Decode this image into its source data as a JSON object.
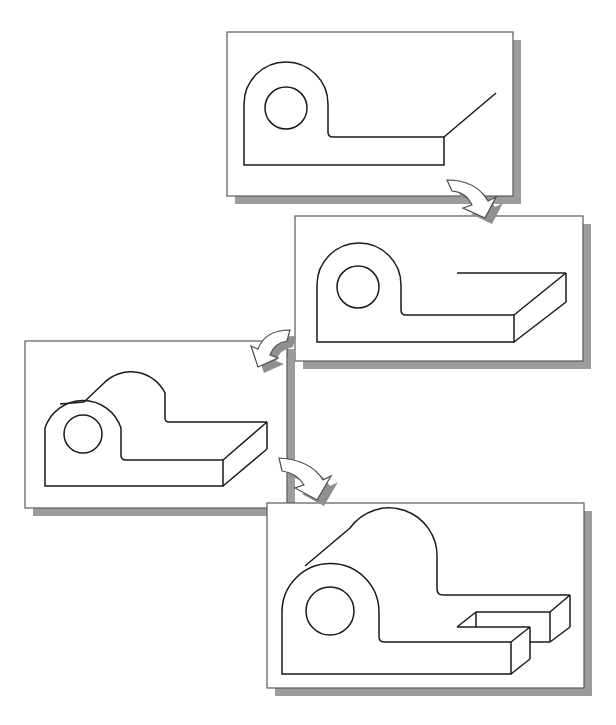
{
  "diagram": {
    "title": "",
    "colors": {
      "background": "#ffffff",
      "panel_fill": "#ffffff",
      "panel_border": "#5a5a5a",
      "shadow": "#9c9c9c",
      "line": "#1a1a1a",
      "arrow_fill": "#ffffff",
      "arrow_stroke": "#4a4a4a"
    },
    "panels": [
      {
        "step": 1,
        "label": "2D profile sketch with extrusion direction line",
        "x": 227,
        "y": 32,
        "w": 286,
        "h": 164
      },
      {
        "step": 2,
        "label": "Base extruded",
        "x": 295,
        "y": 216,
        "w": 288,
        "h": 145
      },
      {
        "step": 3,
        "label": "Full bracket extruded",
        "x": 25,
        "y": 341,
        "w": 262,
        "h": 167
      },
      {
        "step": 4,
        "label": "Slot cut in base",
        "x": 267,
        "y": 503,
        "w": 317,
        "h": 185
      }
    ],
    "arrows": [
      {
        "from": 1,
        "to": 2,
        "direction": "curved-down-right"
      },
      {
        "from": 2,
        "to": 3,
        "direction": "curved-down-left"
      },
      {
        "from": 3,
        "to": 4,
        "direction": "curved-down-right"
      }
    ]
  }
}
